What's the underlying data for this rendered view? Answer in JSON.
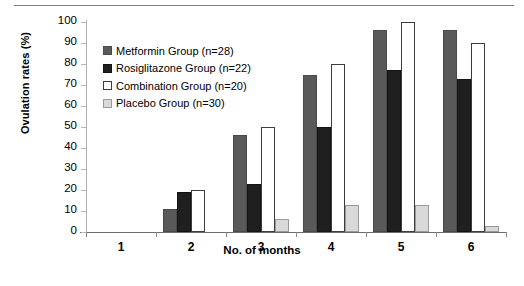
{
  "chart_data": {
    "type": "bar",
    "title": "",
    "xlabel": "No. of months",
    "ylabel": "Ovulation rates (%)",
    "categories": [
      "1",
      "2",
      "3",
      "4",
      "5",
      "6"
    ],
    "ylim": [
      0,
      100
    ],
    "ytick_step": 10,
    "yticks": [
      "100",
      "90",
      "80",
      "70",
      "60",
      "50",
      "40",
      "30",
      "20",
      "10",
      "0"
    ],
    "grid": false,
    "legend_position": "upper-left-inside",
    "series": [
      {
        "name": "Metformin Group (n=28)",
        "color": "#595959",
        "values": [
          0,
          11,
          46,
          75,
          96,
          96
        ]
      },
      {
        "name": "Rosiglitazone Group (n=22)",
        "color": "#1f1f1f",
        "values": [
          0,
          19,
          23,
          50,
          77,
          73
        ]
      },
      {
        "name": "Combination Group (n=20)",
        "color": "#ffffff",
        "values": [
          0,
          20,
          50,
          80,
          100,
          90
        ]
      },
      {
        "name": "Placebo Group (n=30)",
        "color": "#d9d9d9",
        "values": [
          0,
          0,
          6,
          13,
          13,
          3
        ]
      }
    ]
  }
}
